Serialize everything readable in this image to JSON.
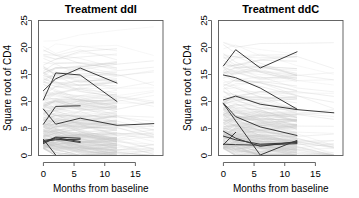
{
  "figure": {
    "background": "#ffffff",
    "panel_count": 2,
    "faint_line_color": "#c8c8c8",
    "highlight_line_color": "#3a3a3a",
    "axis_color": "#555555"
  },
  "chart_data": [
    {
      "type": "line",
      "title": "Treatment ddI",
      "xlabel": "Months from baseline",
      "ylabel": "Square root of CD4",
      "xlim": [
        -0.8,
        19.5
      ],
      "ylim": [
        0,
        25
      ],
      "xticks": [
        0,
        5,
        10,
        15
      ],
      "yticks": [
        0,
        5,
        10,
        15,
        20,
        25
      ],
      "grid": false,
      "legend": "none",
      "obs_times": [
        0,
        2,
        6,
        12,
        18
      ],
      "highlighted": [
        {
          "name": "subject-1",
          "x": [
            0,
            2,
            6,
            12
          ],
          "y": [
            12.0,
            14.2,
            16.2,
            13.4
          ]
        },
        {
          "name": "subject-2",
          "x": [
            0,
            2,
            6,
            12
          ],
          "y": [
            10.3,
            15.3,
            14.9,
            10.0
          ]
        },
        {
          "name": "subject-3",
          "x": [
            0,
            2,
            6
          ],
          "y": [
            5.8,
            9.1,
            9.2
          ]
        },
        {
          "name": "subject-4",
          "x": [
            0,
            2,
            6,
            12,
            18
          ],
          "y": [
            8.6,
            5.8,
            6.9,
            5.6,
            5.9
          ]
        },
        {
          "name": "subject-5",
          "x": [
            0,
            2,
            6
          ],
          "y": [
            2.4,
            3.4,
            3.2
          ]
        },
        {
          "name": "subject-6",
          "x": [
            0,
            2,
            6
          ],
          "y": [
            2.8,
            3.1,
            2.4
          ]
        },
        {
          "name": "subject-7",
          "x": [
            0,
            2,
            6
          ],
          "y": [
            2.2,
            3.3,
            2.6
          ]
        },
        {
          "name": "subject-8",
          "x": [
            0,
            2
          ],
          "y": [
            3.0,
            0.1
          ]
        },
        {
          "name": "subject-9",
          "x": [
            0,
            2,
            6
          ],
          "y": [
            2.6,
            2.9,
            3.0
          ]
        }
      ],
      "faint_band_note": "dense faint trajectories to month 12, sparse to 18"
    },
    {
      "type": "line",
      "title": "Treatment ddC",
      "xlabel": "Months from baseline",
      "ylabel": "Square root of CD4",
      "xlim": [
        -0.8,
        19.5
      ],
      "ylim": [
        0,
        25
      ],
      "xticks": [
        0,
        5,
        10,
        15
      ],
      "yticks": [
        0,
        5,
        10,
        15,
        20,
        25
      ],
      "grid": false,
      "legend": "none",
      "obs_times": [
        0,
        2,
        6,
        12,
        18
      ],
      "highlighted": [
        {
          "name": "subject-1",
          "x": [
            0,
            2,
            6,
            12
          ],
          "y": [
            16.6,
            19.6,
            16.2,
            19.2
          ]
        },
        {
          "name": "subject-2",
          "x": [
            0,
            2,
            6,
            12
          ],
          "y": [
            14.9,
            14.4,
            12.5,
            8.6
          ]
        },
        {
          "name": "subject-3",
          "x": [
            0,
            2,
            6,
            12,
            18
          ],
          "y": [
            10.3,
            11.0,
            9.5,
            8.5,
            7.9
          ]
        },
        {
          "name": "subject-4",
          "x": [
            0,
            2,
            6,
            12
          ],
          "y": [
            9.7,
            7.2,
            5.3,
            3.7
          ]
        },
        {
          "name": "subject-5",
          "x": [
            0,
            2
          ],
          "y": [
            2.0,
            4.3
          ]
        },
        {
          "name": "subject-6",
          "x": [
            0,
            2,
            6,
            12
          ],
          "y": [
            4.5,
            3.2,
            1.7,
            2.6
          ]
        },
        {
          "name": "subject-7",
          "x": [
            0,
            2,
            6,
            12
          ],
          "y": [
            3.6,
            2.9,
            2.1,
            2.4
          ]
        },
        {
          "name": "subject-8",
          "x": [
            0,
            2,
            6,
            12
          ],
          "y": [
            2.1,
            2.0,
            1.9,
            2.2
          ]
        },
        {
          "name": "subject-9",
          "x": [
            0,
            6,
            12
          ],
          "y": [
            9.6,
            0.1,
            2.8
          ]
        }
      ],
      "faint_band_note": "dense faint trajectories to month 12, sparse to 18"
    }
  ]
}
